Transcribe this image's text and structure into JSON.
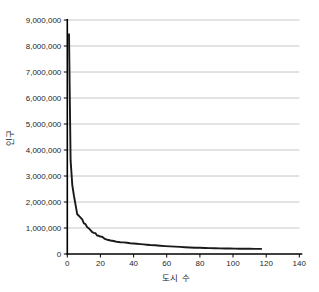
{
  "figure": {
    "background": "#ffffff"
  },
  "chart_data": {
    "type": "line",
    "title": "",
    "xlabel": "도시 수",
    "ylabel": "인구",
    "xlim": [
      0,
      140
    ],
    "ylim": [
      0,
      9000000
    ],
    "x_ticks": [
      0,
      20,
      40,
      60,
      80,
      100,
      120,
      140
    ],
    "y_ticks": [
      0,
      1000000,
      2000000,
      3000000,
      4000000,
      5000000,
      6000000,
      7000000,
      8000000,
      9000000
    ],
    "grid": "horizontal-only",
    "legend": "none",
    "colors": {
      "line": "#1a1a1a",
      "grid": "#c6c6c6",
      "axis": "#000000",
      "text": "#262626"
    },
    "series": [
      {
        "name": "city-population-by-rank",
        "points": [
          [
            1,
            8450000
          ],
          [
            2,
            3600000
          ],
          [
            3,
            2650000
          ],
          [
            4,
            2250000
          ],
          [
            5,
            1880000
          ],
          [
            6,
            1530000
          ],
          [
            7,
            1470000
          ],
          [
            8,
            1400000
          ],
          [
            9,
            1330000
          ],
          [
            10,
            1180000
          ],
          [
            11,
            1150000
          ],
          [
            12,
            1030000
          ],
          [
            13,
            990000
          ],
          [
            14,
            920000
          ],
          [
            15,
            840000
          ],
          [
            16,
            810000
          ],
          [
            17,
            800000
          ],
          [
            18,
            710000
          ],
          [
            19,
            700000
          ],
          [
            20,
            670000
          ],
          [
            21,
            660000
          ],
          [
            22,
            610000
          ],
          [
            23,
            570000
          ],
          [
            24,
            550000
          ],
          [
            25,
            540000
          ],
          [
            26,
            520000
          ],
          [
            27,
            510000
          ],
          [
            28,
            500000
          ],
          [
            29,
            480000
          ],
          [
            30,
            470000
          ],
          [
            32,
            455000
          ],
          [
            34,
            445000
          ],
          [
            36,
            430000
          ],
          [
            38,
            415000
          ],
          [
            40,
            405000
          ],
          [
            42,
            393000
          ],
          [
            44,
            382000
          ],
          [
            46,
            371000
          ],
          [
            48,
            359000
          ],
          [
            50,
            348000
          ],
          [
            53,
            333000
          ],
          [
            56,
            318000
          ],
          [
            59,
            305000
          ],
          [
            62,
            294000
          ],
          [
            65,
            284000
          ],
          [
            68,
            274000
          ],
          [
            71,
            263000
          ],
          [
            74,
            250000
          ],
          [
            77,
            243000
          ],
          [
            80,
            237000
          ],
          [
            83,
            231000
          ],
          [
            86,
            226000
          ],
          [
            89,
            221000
          ],
          [
            92,
            217000
          ],
          [
            95,
            213000
          ],
          [
            98,
            210000
          ],
          [
            101,
            207000
          ],
          [
            104,
            204000
          ],
          [
            107,
            202000
          ],
          [
            110,
            200000
          ],
          [
            113,
            198000
          ],
          [
            116,
            196000
          ],
          [
            117,
            195000
          ]
        ]
      }
    ]
  }
}
